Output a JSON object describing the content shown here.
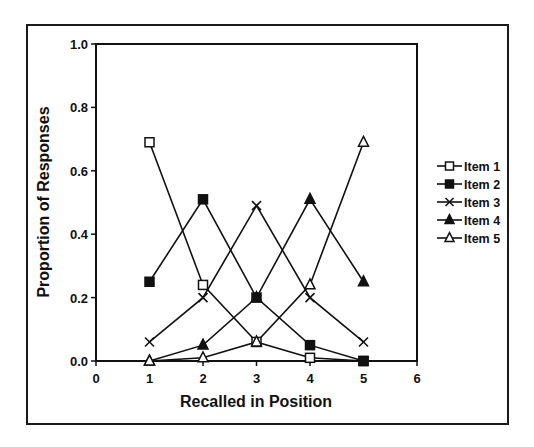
{
  "chart_data": {
    "type": "line",
    "title": "",
    "xlabel": "Recalled in Position",
    "ylabel": "Proportion of Responses",
    "xlim": [
      0,
      6
    ],
    "ylim": [
      0,
      1.0
    ],
    "x_ticks": [
      "0",
      "1",
      "2",
      "3",
      "4",
      "5",
      "6"
    ],
    "y_ticks": [
      "0.0",
      "0.2",
      "0.4",
      "0.6",
      "0.8",
      "1.0"
    ],
    "grid": false,
    "legend_position": "right",
    "x": [
      1,
      2,
      3,
      4,
      5
    ],
    "series": [
      {
        "name": "Item 1",
        "marker": "open-square",
        "values": [
          0.69,
          0.24,
          0.06,
          0.01,
          0.0
        ]
      },
      {
        "name": "Item 2",
        "marker": "filled-square",
        "values": [
          0.25,
          0.51,
          0.2,
          0.05,
          0.0
        ]
      },
      {
        "name": "Item 3",
        "marker": "x",
        "values": [
          0.06,
          0.2,
          0.49,
          0.2,
          0.06
        ]
      },
      {
        "name": "Item 4",
        "marker": "filled-triangle",
        "values": [
          0.0,
          0.05,
          0.2,
          0.51,
          0.25
        ]
      },
      {
        "name": "Item 5",
        "marker": "open-triangle",
        "values": [
          0.0,
          0.01,
          0.06,
          0.24,
          0.69
        ]
      }
    ]
  },
  "legend": {
    "items": [
      "Item 1",
      "Item 2",
      "Item 3",
      "Item 4",
      "Item 5"
    ]
  },
  "axes": {
    "xlabel": "Recalled in Position",
    "ylabel": "Proportion of Responses"
  }
}
